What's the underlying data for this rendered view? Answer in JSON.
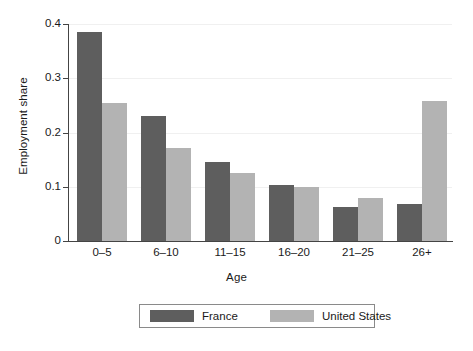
{
  "chart_data": {
    "type": "bar",
    "title": "",
    "xlabel": "Age",
    "ylabel": "Employment share",
    "categories": [
      "0–5",
      "6–10",
      "11–15",
      "16–20",
      "21–25",
      "26+"
    ],
    "series": [
      {
        "name": "France",
        "color": "#5e5e5e",
        "values": [
          0.385,
          0.23,
          0.146,
          0.104,
          0.063,
          0.068
        ]
      },
      {
        "name": "United States",
        "color": "#b3b3b3",
        "values": [
          0.255,
          0.171,
          0.126,
          0.1,
          0.08,
          0.258
        ]
      }
    ],
    "ylim": [
      0,
      0.4
    ],
    "yticks": [
      0,
      0.1,
      0.2,
      0.3,
      0.4
    ],
    "ytick_labels": [
      "0",
      "0.1",
      "0.2",
      "0.3",
      "0.4"
    ],
    "grid": true,
    "legend_position": "bottom-center",
    "axis_color": "#444444",
    "grid_color": "#f0f0f0",
    "background": "#ffffff"
  }
}
